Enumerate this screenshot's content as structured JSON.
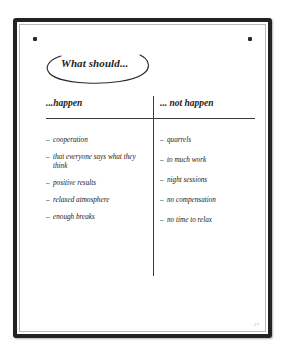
{
  "board": {
    "title": "What should...",
    "page_number": "27",
    "frame_color": "#232323",
    "ink_color": "#1d1d1d",
    "sheet_color": "#ffffff",
    "magnets": [
      {
        "name": "top-left-magnet"
      },
      {
        "name": "top-right-magnet"
      }
    ]
  },
  "columns": {
    "left": {
      "header": "...happen",
      "items": [
        "cooperation",
        "that everyone says what they think",
        "positive results",
        "relaxed atmosphere",
        "enough breaks"
      ]
    },
    "right": {
      "header": "... not happen",
      "items": [
        "quarrels",
        "to much work",
        "night sessions",
        "no compensation",
        "no time to relax"
      ]
    }
  }
}
